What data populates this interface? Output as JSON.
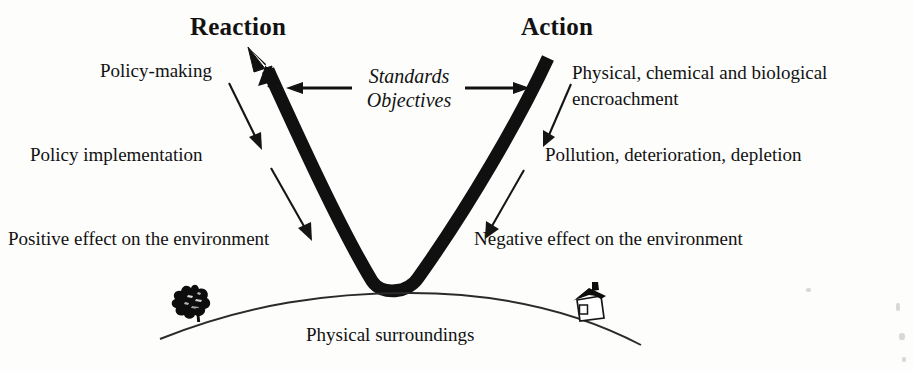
{
  "diagram": {
    "type": "concept-diagram",
    "title_left": "Reaction",
    "title_right": "Action",
    "center_line_1": "Standards",
    "center_line_2": "Objectives",
    "ground_label": "Physical surroundings",
    "left_chain": [
      "Policy-making",
      "Policy implementation",
      "Positive effect on the environment"
    ],
    "right_chain": [
      "Physical, chemical and biological",
      "encroachment",
      "Pollution, deterioration, depletion",
      "Negative effect on the environment"
    ],
    "icons": {
      "tree": "tree-icon",
      "house": "house-icon",
      "v_arrow": "v-flow-arrow",
      "left_arrow": "arrow-left-icon",
      "right_arrow": "arrow-right-icon"
    },
    "colors": {
      "ink": "#121212",
      "stroke": "#1a1a1a",
      "background": "#fdfdfc"
    }
  }
}
